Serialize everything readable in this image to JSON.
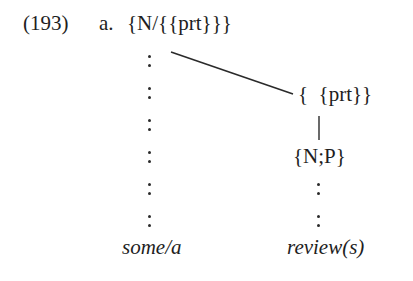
{
  "example": {
    "number": "(193)",
    "sub_label": "a.",
    "top_node": "{N/{{prt}}}",
    "right_node": "{  {prt}}",
    "right_lower_node": "{N;P}",
    "left_gloss": "some/a",
    "right_gloss": "review(s)"
  },
  "diagram": {
    "left_dependency_colons": 6,
    "right_dependency_colons": 2,
    "line_color": "#2a2a2a"
  }
}
